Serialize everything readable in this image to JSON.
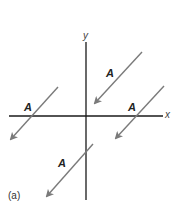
{
  "figure": {
    "caption": "(a)",
    "axes": {
      "x_label": "x",
      "y_label": "y",
      "color": "#1a1a1a"
    },
    "arrow_color": "#7a7a7a",
    "vectors": [
      {
        "label": "A",
        "from": [
          142,
          52
        ],
        "to": [
          93,
          105
        ]
      },
      {
        "label": "A",
        "from": [
          164,
          86
        ],
        "to": [
          114,
          140
        ]
      },
      {
        "label": "A",
        "from": [
          58,
          87
        ],
        "to": [
          9,
          141
        ]
      },
      {
        "label": "A",
        "from": [
          93,
          144
        ],
        "to": [
          45,
          198
        ]
      }
    ]
  }
}
